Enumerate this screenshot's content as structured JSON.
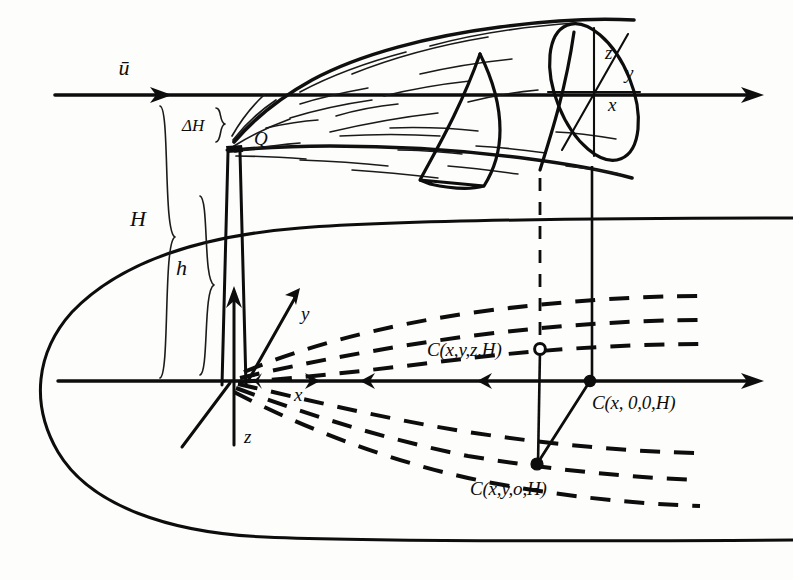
{
  "figure": {
    "background_color": "#fdfdfb",
    "ink_color": "#0d0d0d"
  },
  "labels": {
    "wind": "ū",
    "delta_h": "ΔH",
    "stack_height": "h",
    "effective_height": "H",
    "source": "Q",
    "axis_x_origin": "x",
    "axis_y_origin": "y",
    "axis_z_origin": "z",
    "axis_x_plume": "x",
    "axis_y_plume": "y",
    "axis_z_plume": "z",
    "conc_xyzh": "C(x,y,z,H)",
    "conc_x00h": "C(x, 0,0,H)",
    "conc_xy0h": "C(x,y,o,H)"
  },
  "annotations": {
    "wind_arrow": "rightward-arrow",
    "plume_centerline_axis": "horizontal-axis-arrow",
    "ground_axis": "horizontal-axis-arrow",
    "isopleth_style": "dashed",
    "brace_count": 3,
    "concentration_point_count": 3
  },
  "geometry": {
    "wind_line_y": 95,
    "ground_axis_y": 381,
    "origin_x": 232,
    "source_point": {
      "x": 233,
      "y": 146
    },
    "plume_end_x": 650
  }
}
